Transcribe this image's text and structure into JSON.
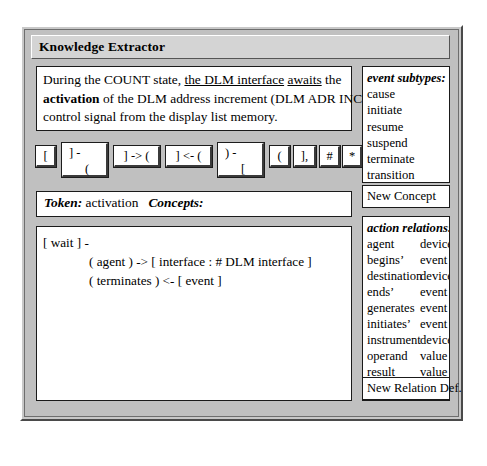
{
  "window": {
    "title": "Knowledge Extractor"
  },
  "sentence": {
    "lines": [
      [
        {
          "t": "During the COUNT state, ",
          "style": "plain"
        },
        {
          "t": "the DLM interface",
          "style": "underline"
        },
        {
          "t": " ",
          "style": "plain"
        },
        {
          "t": "awaits",
          "style": "underline"
        },
        {
          "t": " the",
          "style": "plain"
        }
      ],
      [
        {
          "t": "activation",
          "style": "bold"
        },
        {
          "t": " of the DLM address increment (DLM ADR INC)",
          "style": "plain"
        }
      ],
      [
        {
          "t": "control signal from the display list memory.",
          "style": "plain"
        }
      ]
    ],
    "line1_prefix": "During the COUNT state, ",
    "line1_link1": "the DLM interface",
    "line1_link2": "awaits",
    "line1_suffix": " the",
    "line2_bold": "activation",
    "line2_rest": " of the DLM address increment (DLM ADR INC)",
    "line3": "control signal from the display list memory."
  },
  "palette": {
    "buttons": [
      {
        "name": "open-bracket",
        "row1": "[",
        "row2": "",
        "width": 20,
        "tall": false,
        "center": true
      },
      {
        "name": "close-bracket-dash-paren",
        "row1": "] -",
        "row2": "(",
        "width": 46,
        "tall": true,
        "center": false
      },
      {
        "name": "close-bracket-arrow-right-paren",
        "row1": "] -> (",
        "row2": "",
        "width": 46,
        "tall": false,
        "center": true
      },
      {
        "name": "close-bracket-arrow-left-paren",
        "row1": "] <- (",
        "row2": "",
        "width": 46,
        "tall": false,
        "center": true
      },
      {
        "name": "close-paren-dash-open-bracket",
        "row1": ") -",
        "row2": "[",
        "width": 46,
        "tall": true,
        "center": false
      },
      {
        "name": "open-paren",
        "row1": "(",
        "row2": "",
        "width": 20,
        "tall": false,
        "center": true
      },
      {
        "name": "close-bracket-comma",
        "row1": "],",
        "row2": "",
        "width": 22,
        "tall": false,
        "center": true
      },
      {
        "name": "hash",
        "row1": "#",
        "row2": "",
        "width": 20,
        "tall": false,
        "center": true
      },
      {
        "name": "asterisk",
        "row1": "*",
        "row2": "",
        "width": 19,
        "tall": false,
        "center": true
      },
      {
        "name": "colon",
        "row1": ":",
        "row2": "",
        "width": 19,
        "tall": false,
        "center": true
      }
    ]
  },
  "token_bar": {
    "token_label": "Token:",
    "token_value": "activation",
    "concepts_label": "Concepts:",
    "concepts_value": ""
  },
  "frame": {
    "lines": [
      "[ wait ] -",
      "( agent ) -> [ interface : # DLM interface ]",
      "( terminates ) <- [ event ]"
    ],
    "line0": "[ wait ] -",
    "line1": "( agent ) -> [ interface : # DLM interface ]",
    "line2": "( terminates ) <- [ event ]"
  },
  "concepts_panel": {
    "header": "event subtypes:",
    "items": [
      "cause",
      "initiate",
      "resume",
      "suspend",
      "terminate",
      "transition"
    ],
    "new_button": "New Concept"
  },
  "relations_panel": {
    "header": "action relations:",
    "rows": [
      {
        "name": "agent",
        "type": "device",
        "selected": false
      },
      {
        "name": "begins’",
        "type": "event",
        "selected": false
      },
      {
        "name": "destination",
        "type": "device",
        "selected": false
      },
      {
        "name": "ends’",
        "type": "event",
        "selected": false
      },
      {
        "name": "generates",
        "type": "event",
        "selected": false
      },
      {
        "name": "initiates’",
        "type": "event",
        "selected": false
      },
      {
        "name": "instrument",
        "type": "device",
        "selected": false
      },
      {
        "name": "operand",
        "type": "value",
        "selected": false
      },
      {
        "name": "result",
        "type": "value",
        "selected": false
      },
      {
        "name": "source",
        "type": "device",
        "selected": false
      },
      {
        "name": "terminates’",
        "type": "event",
        "selected": true
      }
    ],
    "new_button": "New Relation Def."
  },
  "colors": {
    "window_face": "#c0c0c0",
    "title_face": "#d4d4d4",
    "panel_bg": "#ffffff",
    "text": "#000000",
    "shadow": "#4a4a4a",
    "highlight": "#ffffff"
  }
}
